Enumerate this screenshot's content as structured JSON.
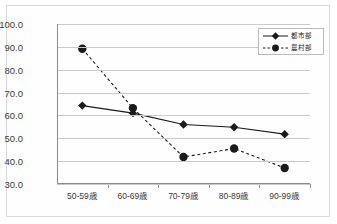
{
  "chart_data": {
    "type": "line",
    "title": "",
    "xlabel": "",
    "ylabel": "",
    "categories": [
      "50-59歳",
      "60-69歳",
      "70-79歳",
      "80-89歳",
      "90-99歳"
    ],
    "ylim": [
      30.0,
      100.0
    ],
    "ytick_labels": [
      "100.0",
      "90.0",
      "80.0",
      "70.0",
      "60.0",
      "50.0",
      "40.0",
      "30.0"
    ],
    "ytick_values": [
      100.0,
      90.0,
      80.0,
      70.0,
      60.0,
      50.0,
      40.0,
      30.0
    ],
    "grid": true,
    "legend_position": "top-right",
    "series": [
      {
        "name": "都市部",
        "values": [
          64.3,
          61.0,
          56.0,
          54.8,
          51.8
        ],
        "line_style": "solid",
        "marker": "diamond",
        "color": "#1a1a1a"
      },
      {
        "name": "農村部",
        "values": [
          89.2,
          63.2,
          41.8,
          45.5,
          37.0
        ],
        "line_style": "dashed",
        "marker": "circle",
        "color": "#1a1a1a"
      }
    ]
  },
  "legend": {
    "entries": [
      {
        "label": "都市部"
      },
      {
        "label": "農村部"
      }
    ]
  },
  "colors": {
    "series": "#1a1a1a",
    "grid": "#c9c9c9",
    "axis": "#8c8c8c",
    "frame": "#d8d8d8",
    "text": "#3a3a3a"
  }
}
